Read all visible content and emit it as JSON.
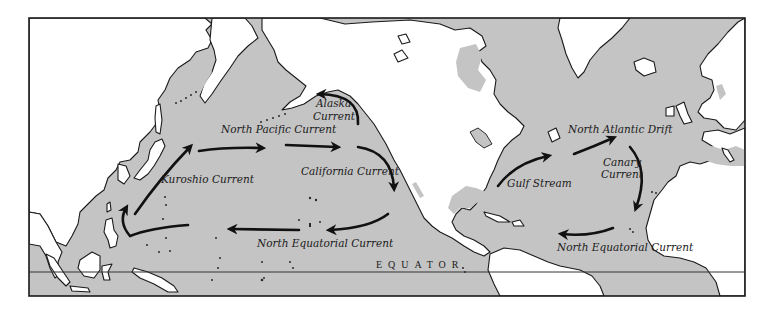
{
  "map": {
    "title": "Ocean surface currents of the North Pacific and North Atlantic",
    "frame": {
      "x": 29,
      "y": 18,
      "width": 716,
      "height": 278
    },
    "colors": {
      "ocean": "#c4c4c4",
      "land": "#ffffff",
      "outline": "#1a1a1a",
      "arrow": "#111111"
    },
    "equator": {
      "label": "EQUATOR",
      "y": 272,
      "label_x": 376,
      "label_y": 268
    }
  },
  "labels": [
    {
      "id": "north-pacific-current",
      "text": "North Pacific Current",
      "x": 221,
      "y": 133
    },
    {
      "id": "alaska-current-line1",
      "text": "Alaska",
      "x": 316,
      "y": 107
    },
    {
      "id": "alaska-current-line2",
      "text": "Current",
      "x": 313,
      "y": 120
    },
    {
      "id": "kuroshio-current",
      "text": "Kuroshio Current",
      "x": 161,
      "y": 183
    },
    {
      "id": "california-current",
      "text": "California Current",
      "x": 301,
      "y": 175
    },
    {
      "id": "north-equatorial-current-pacific",
      "text": "North Equatorial Current",
      "x": 257,
      "y": 247
    },
    {
      "id": "north-atlantic-drift",
      "text": "North Atlantic Drift",
      "x": 568,
      "y": 133
    },
    {
      "id": "canary-current-line1",
      "text": "Canary",
      "x": 603,
      "y": 166
    },
    {
      "id": "canary-current-line2",
      "text": "Current",
      "x": 601,
      "y": 178
    },
    {
      "id": "gulf-stream",
      "text": "Gulf Stream",
      "x": 507,
      "y": 187
    },
    {
      "id": "north-equatorial-current-atlantic",
      "text": "North Equatorial Current",
      "x": 557,
      "y": 251
    }
  ],
  "arrows": [
    {
      "id": "kuroshio-arrow",
      "d": "M 135 214 Q 160 178 190 147"
    },
    {
      "id": "north-pacific-arrow-1",
      "d": "M 199 151 Q 225 147 262 148"
    },
    {
      "id": "north-pacific-arrow-2",
      "d": "M 286 145 Q 310 146 337 147"
    },
    {
      "id": "california-arrow",
      "d": "M 358 147 Q 392 152 394 188"
    },
    {
      "id": "alaska-arrow",
      "d": "M 358 124 Q 360 95 320 94"
    },
    {
      "id": "north-equatorial-pacific-arrow-1",
      "d": "M 388 214 Q 370 228 330 230"
    },
    {
      "id": "north-equatorial-pacific-arrow-2",
      "d": "M 299 230 L 231 229"
    },
    {
      "id": "north-equatorial-pacific-arrow-3",
      "d": "M 188 225 Q 150 228 130 236 Q 118 222 126 208"
    },
    {
      "id": "gulf-stream-arrow",
      "d": "M 498 186 Q 515 163 548 156"
    },
    {
      "id": "north-atlantic-drift-arrow",
      "d": "M 574 154 Q 595 146 613 138"
    },
    {
      "id": "canary-arrow",
      "d": "M 630 147 Q 650 170 636 208"
    },
    {
      "id": "north-equatorial-atlantic-arrow",
      "d": "M 613 228 Q 590 237 562 234"
    }
  ]
}
